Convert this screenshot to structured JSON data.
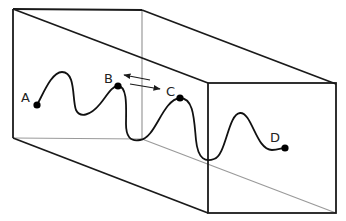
{
  "diagram": {
    "type": "3d-box-with-wave-path",
    "colors": {
      "visible_edge": "#1a1a1a",
      "hidden_edge": "#9a9a9a",
      "curve": "#111111",
      "point": "#000000",
      "background": "#ffffff"
    },
    "points": [
      {
        "id": "A",
        "label": "A",
        "x": 37,
        "y": 105,
        "label_x": 21,
        "label_y": 102
      },
      {
        "id": "B",
        "label": "B",
        "x": 118,
        "y": 86,
        "label_x": 104,
        "label_y": 83
      },
      {
        "id": "C",
        "label": "C",
        "x": 180,
        "y": 98,
        "label_x": 166,
        "label_y": 96
      },
      {
        "id": "D",
        "label": "D",
        "x": 285,
        "y": 148,
        "label_x": 270,
        "label_y": 142
      }
    ],
    "arrows": [
      {
        "name": "arrow-toward-b",
        "direction": "left"
      },
      {
        "name": "arrow-toward-c",
        "direction": "right"
      }
    ]
  }
}
